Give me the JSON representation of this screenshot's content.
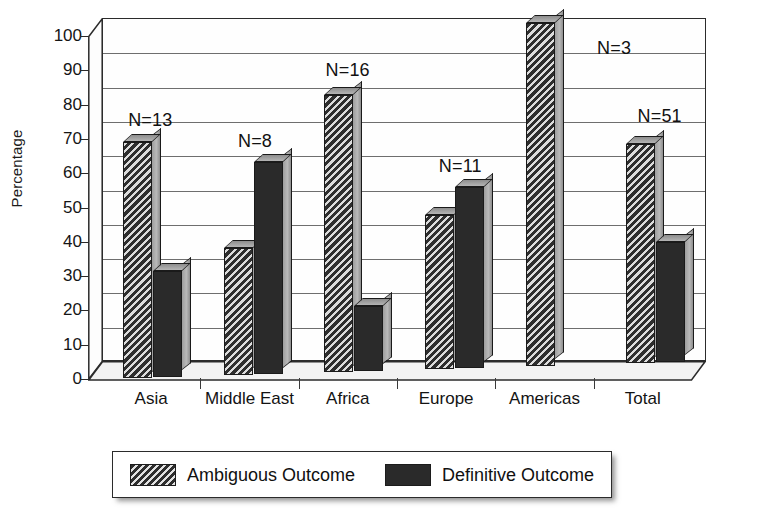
{
  "chart_data": {
    "type": "bar",
    "title": "",
    "subtitle": "",
    "xlabel": "",
    "ylabel": "Percentage",
    "ylim": [
      0,
      100
    ],
    "ytick_step": 10,
    "yticks": [
      0,
      10,
      20,
      30,
      40,
      50,
      60,
      70,
      80,
      90,
      100
    ],
    "grid": true,
    "grid_axis": "y",
    "style": "grayscale-3d-scanned",
    "legend_position": "bottom",
    "categories": [
      "Asia",
      "Middle East",
      "Africa",
      "Europe",
      "Americas",
      "Total"
    ],
    "series": [
      {
        "name": "Ambiguous Outcome",
        "pattern": "diagonal-hatch",
        "color": "#2e2e2e",
        "values": [
          69,
          37,
          81,
          45,
          100,
          64
        ]
      },
      {
        "name": "Definitive Outcome",
        "pattern": "solid",
        "color": "#2a2a2a",
        "values": [
          31,
          62,
          19,
          53,
          0,
          35
        ]
      }
    ],
    "annotations": [
      {
        "category": "Asia",
        "text": "N=13"
      },
      {
        "category": "Middle East",
        "text": "N=8"
      },
      {
        "category": "Africa",
        "text": "N=16"
      },
      {
        "category": "Europe",
        "text": "N=11"
      },
      {
        "category": "Americas",
        "text": "N=3"
      },
      {
        "category": "Total",
        "text": "N=51"
      }
    ]
  },
  "legend": {
    "entries": [
      {
        "label": "Ambiguous Outcome",
        "swatch": "hatched-swatch"
      },
      {
        "label": "Definitive Outcome",
        "swatch": "solid-swatch"
      }
    ]
  }
}
